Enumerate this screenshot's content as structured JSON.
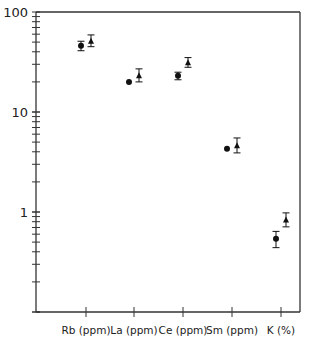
{
  "chart_data": {
    "type": "scatter",
    "title": "",
    "xlabel": "",
    "ylabel": "",
    "yscale": "log",
    "ylim": [
      0.1,
      100
    ],
    "y_tick_labels": [
      "100",
      "10",
      "1"
    ],
    "grid": false,
    "legend": null,
    "categories": [
      "Rb (ppm)",
      "La (ppm)",
      "Ce (ppm)",
      "Sm (ppm)",
      "K (%)"
    ],
    "series": [
      {
        "name": "circles",
        "marker": "circle",
        "values": [
          46,
          20,
          23,
          4.3,
          0.54
        ],
        "error_low": [
          41,
          null,
          21,
          null,
          0.44
        ],
        "error_high": [
          51,
          null,
          25,
          null,
          0.64
        ]
      },
      {
        "name": "triangles",
        "marker": "triangle",
        "values": [
          51,
          23,
          31,
          4.6,
          0.83
        ],
        "error_low": [
          45,
          20,
          28,
          3.9,
          0.71
        ],
        "error_high": [
          59,
          27,
          35,
          5.5,
          0.98
        ]
      }
    ]
  },
  "axis": {
    "y_labels": [
      {
        "text": "100",
        "value": 100
      },
      {
        "text": "10",
        "value": 10
      },
      {
        "text": "1",
        "value": 1
      }
    ],
    "x_labels": [
      "Rb (ppm)",
      "La (ppm)",
      "Ce (ppm)",
      "Sm (ppm)",
      "K (%)"
    ]
  },
  "colors": {
    "axis": "#333333",
    "marker": "#111111",
    "background": "#ffffff"
  }
}
